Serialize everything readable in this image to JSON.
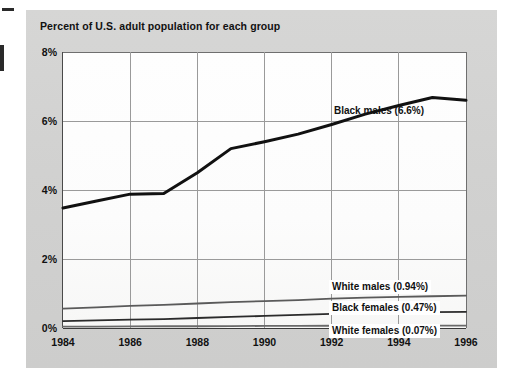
{
  "chart_data": {
    "type": "line",
    "title": "Percent of U.S. adult population for each group",
    "xlabel": "",
    "ylabel": "",
    "xlim": [
      1984,
      1996
    ],
    "ylim": [
      0,
      8
    ],
    "grid": true,
    "legend_position": "inline-annotations",
    "x": [
      1984,
      1985,
      1986,
      1987,
      1988,
      1989,
      1990,
      1991,
      1992,
      1993,
      1994,
      1995,
      1996
    ],
    "xticks": [
      "1984",
      "1986",
      "1988",
      "1990",
      "1992",
      "1994",
      "1996"
    ],
    "yticks": [
      "0%",
      "2%",
      "4%",
      "6%",
      "8%"
    ],
    "series": [
      {
        "name": "Black males",
        "end_value": 6.6,
        "annotation": "Black males (6.6%)",
        "color": "#111111",
        "values": [
          3.48,
          3.68,
          3.88,
          3.9,
          4.5,
          5.2,
          5.4,
          5.62,
          5.9,
          6.2,
          6.45,
          6.68,
          6.6
        ]
      },
      {
        "name": "White males",
        "end_value": 0.94,
        "annotation": "White males (0.94%)",
        "color": "#5a5a5a",
        "values": [
          0.56,
          0.6,
          0.64,
          0.67,
          0.71,
          0.75,
          0.78,
          0.81,
          0.85,
          0.88,
          0.9,
          0.92,
          0.94
        ]
      },
      {
        "name": "Black females",
        "end_value": 0.47,
        "annotation": "Black females (0.47%)",
        "color": "#2b2b2b",
        "values": [
          0.2,
          0.22,
          0.24,
          0.26,
          0.29,
          0.32,
          0.35,
          0.38,
          0.41,
          0.43,
          0.45,
          0.46,
          0.47
        ]
      },
      {
        "name": "White females",
        "end_value": 0.07,
        "annotation": "White females (0.07%)",
        "color": "#6a6a6a",
        "values": [
          0.04,
          0.04,
          0.045,
          0.05,
          0.05,
          0.055,
          0.06,
          0.06,
          0.065,
          0.065,
          0.07,
          0.07,
          0.07
        ]
      }
    ]
  }
}
